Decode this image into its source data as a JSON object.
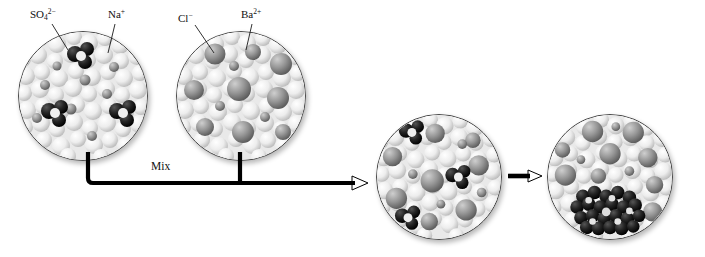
{
  "diagram": {
    "background_color": "#ffffff"
  },
  "labels": {
    "sulfate": {
      "text": "SO",
      "sub": "4",
      "sup": "2−",
      "full": "SO4 2-"
    },
    "sodium": {
      "text": "Na",
      "sup": "+",
      "full": "Na+"
    },
    "chloride": {
      "text": "Cl",
      "sup": "−",
      "full": "Cl-"
    },
    "barium": {
      "text": "Ba",
      "sup": "2+",
      "full": "Ba2+"
    }
  },
  "arrows": {
    "mix_label": "Mix",
    "mix_direction": "right",
    "reaction_direction": "right"
  },
  "beakers": [
    {
      "id": "sodium-sulfate-solution",
      "name": "Na2SO4 solution",
      "stage": 1
    },
    {
      "id": "barium-chloride-solution",
      "name": "BaCl2 solution",
      "stage": 1
    },
    {
      "id": "mixed-solution",
      "name": "mixed solution",
      "stage": 2
    },
    {
      "id": "precipitate-solution",
      "name": "BaSO4 precipitate",
      "stage": 3
    }
  ],
  "colors": {
    "water": "#e8e8e8",
    "ion_gray": "#8f8f8f",
    "dark_particle": "#1c1c1c",
    "outline": "#4a4a4a",
    "arrow": "#000000"
  }
}
